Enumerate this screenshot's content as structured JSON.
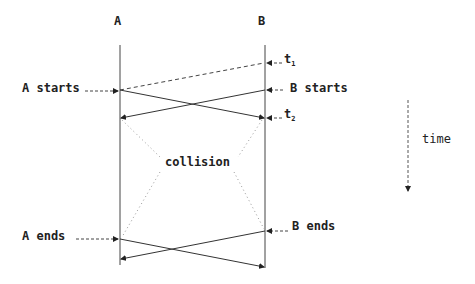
{
  "diagram": {
    "type": "timing-diagram",
    "stations": [
      {
        "id": "A",
        "label": "A"
      },
      {
        "id": "B",
        "label": "B"
      }
    ],
    "events": {
      "a_starts": "A starts",
      "b_starts": "B starts",
      "a_ends": "A ends",
      "b_ends": "B ends",
      "t1": "t",
      "t1_sub": "1",
      "t2": "t",
      "t2_sub": "2",
      "collision": "collision"
    },
    "time_axis": {
      "label": "time"
    }
  }
}
